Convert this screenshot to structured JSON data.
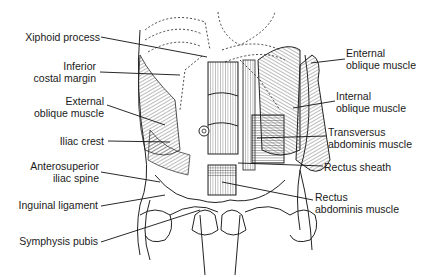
{
  "diagram": {
    "type": "anatomical-illustration",
    "labels_left": [
      {
        "id": "xiphoid",
        "line1": "Xiphoid process",
        "line2": ""
      },
      {
        "id": "costal",
        "line1": "Inferior",
        "line2": "costal margin"
      },
      {
        "id": "ext_oblique_left",
        "line1": "External",
        "line2": "oblique muscle"
      },
      {
        "id": "iliac_crest",
        "line1": "Iliac crest",
        "line2": ""
      },
      {
        "id": "asis",
        "line1": "Anterosuperior",
        "line2": "iliac spine"
      },
      {
        "id": "inguinal",
        "line1": "Inguinal ligament",
        "line2": ""
      },
      {
        "id": "symphysis",
        "line1": "Symphysis pubis",
        "line2": ""
      }
    ],
    "labels_right": [
      {
        "id": "ext_oblique_right",
        "line1": "Enternal",
        "line2": "oblique muscle"
      },
      {
        "id": "int_oblique",
        "line1": "Internal",
        "line2": "oblique muscle"
      },
      {
        "id": "transversus",
        "line1": "Transversus",
        "line2": "abdominis muscle"
      },
      {
        "id": "rectus_sheath",
        "line1": "Rectus sheath",
        "line2": ""
      },
      {
        "id": "rectus_abdominis",
        "line1": "Rectus",
        "line2": "abdominis muscle"
      }
    ]
  }
}
